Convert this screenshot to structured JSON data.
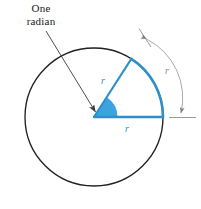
{
  "figure": {
    "title_lines": [
      "One",
      "radian"
    ],
    "colors": {
      "circle_outline": "#231f20",
      "radius_blue": "#2f8fc9",
      "wedge_fill": "#3ba3dd",
      "arc_blue": "#2f8fc9",
      "callout_arrow": "#3a3a3a",
      "measure_gray": "#9a9a9a",
      "text": "#1a1a1a"
    },
    "labels": {
      "upper_radius": "r",
      "lower_radius": "r",
      "arc_length": "r"
    },
    "geometry": {
      "center_x": 94,
      "center_y": 117,
      "radius": 69,
      "angle_degrees": 57.3,
      "angle_radians": 1
    },
    "callout": {
      "text_line1": "One",
      "text_line2": "radian",
      "arrow_from_x": 46,
      "arrow_from_y": 31,
      "arrow_to_x": 95,
      "arrow_to_y": 112
    }
  }
}
